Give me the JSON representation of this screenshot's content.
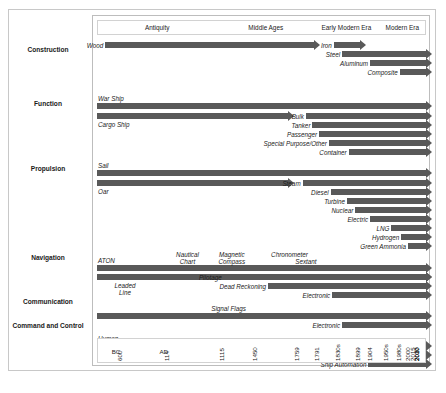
{
  "chart_data": {
    "type": "bar",
    "chart_kind": "timeline-gantt",
    "title": "",
    "xlabel": "",
    "ylabel": "",
    "grid": false,
    "legend": "none",
    "eras": [
      {
        "name": "Antiquity",
        "left_pct": 0.0,
        "width_pct": 36.0
      },
      {
        "name": "Middle Ages",
        "left_pct": 36.0,
        "width_pct": 30.0
      },
      {
        "name": "Early Modern Era",
        "left_pct": 66.0,
        "width_pct": 19.0
      },
      {
        "name": "Modern Era",
        "left_pct": 85.0,
        "width_pct": 15.0
      }
    ],
    "axis_ticks": [
      {
        "label": "600",
        "prefix": "BC",
        "pos_pct": 7.5
      },
      {
        "label": "114",
        "prefix": "AD",
        "pos_pct": 22.0
      },
      {
        "label": "1115",
        "prefix": "",
        "pos_pct": 38.5
      },
      {
        "label": "1450",
        "prefix": "",
        "pos_pct": 48.5
      },
      {
        "label": "1759",
        "prefix": "",
        "pos_pct": 61.5
      },
      {
        "label": "1791",
        "prefix": "",
        "pos_pct": 67.5
      },
      {
        "label": "1830s",
        "prefix": "",
        "pos_pct": 74.0
      },
      {
        "label": "1899",
        "prefix": "",
        "pos_pct": 80.0
      },
      {
        "label": "1904",
        "prefix": "",
        "pos_pct": 83.5
      },
      {
        "label": "1950s",
        "prefix": "",
        "pos_pct": 88.5
      },
      {
        "label": "1980s",
        "prefix": "",
        "pos_pct": 92.5
      },
      {
        "label": "2000",
        "prefix": "",
        "pos_pct": 95.0
      },
      {
        "label": "2015",
        "prefix": "",
        "pos_pct": 96.8
      },
      {
        "label": "2017",
        "prefix": "",
        "pos_pct": 98.0
      },
      {
        "label": "2020",
        "prefix": "",
        "pos_pct": 99.0
      },
      {
        "label": "2030",
        "prefix": "",
        "pos_pct": 100.0
      }
    ],
    "categories": [
      "Construction",
      "Function",
      "Propulsion",
      "Navigation",
      "Communication",
      "Command and Control"
    ],
    "category_label_tops": [
      36,
      90,
      155,
      244,
      288,
      312
    ],
    "bars": [
      {
        "category": "Construction",
        "name": "Wood",
        "start_pct": 2.5,
        "end_pct": 66.0,
        "row_top": 5,
        "label_side": "left"
      },
      {
        "category": "Construction",
        "name": "Iron",
        "start_pct": 72.0,
        "end_pct": 80.0,
        "row_top": 5,
        "label_side": "left"
      },
      {
        "category": "Construction",
        "name": "Steel",
        "start_pct": 74.5,
        "end_pct": 100.0,
        "row_top": 14,
        "label_side": "left"
      },
      {
        "category": "Construction",
        "name": "Aluminum",
        "start_pct": 83.0,
        "end_pct": 100.0,
        "row_top": 23,
        "label_side": "left"
      },
      {
        "category": "Construction",
        "name": "Composite",
        "start_pct": 92.0,
        "end_pct": 100.0,
        "row_top": 32,
        "label_side": "left"
      },
      {
        "category": "Function",
        "name": "War Ship",
        "start_pct": 0.0,
        "end_pct": 100.0,
        "row_top": 66,
        "label_side": "above"
      },
      {
        "category": "Function",
        "name": "Cargo Ship",
        "start_pct": 0.0,
        "end_pct": 58.0,
        "row_top": 76,
        "label_side": "below"
      },
      {
        "category": "Function",
        "name": "Bulk",
        "start_pct": 63.5,
        "end_pct": 100.0,
        "row_top": 76,
        "label_side": "left"
      },
      {
        "category": "Function",
        "name": "Tanker",
        "start_pct": 65.5,
        "end_pct": 100.0,
        "row_top": 85,
        "label_side": "left"
      },
      {
        "category": "Function",
        "name": "Passenger",
        "start_pct": 67.5,
        "end_pct": 100.0,
        "row_top": 94,
        "label_side": "left"
      },
      {
        "category": "Function",
        "name": "Special Purpose/Other",
        "start_pct": 70.5,
        "end_pct": 100.0,
        "row_top": 103,
        "label_side": "left"
      },
      {
        "category": "Function",
        "name": "Container",
        "start_pct": 76.5,
        "end_pct": 100.0,
        "row_top": 112,
        "label_side": "left"
      },
      {
        "category": "Propulsion",
        "name": "Sail",
        "start_pct": 0.0,
        "end_pct": 100.0,
        "row_top": 133,
        "label_side": "above"
      },
      {
        "category": "Propulsion",
        "name": "Oar",
        "start_pct": 0.0,
        "end_pct": 58.0,
        "row_top": 143,
        "label_side": "below"
      },
      {
        "category": "Propulsion",
        "name": "Steam",
        "start_pct": 62.5,
        "end_pct": 100.0,
        "row_top": 143,
        "label_side": "left"
      },
      {
        "category": "Propulsion",
        "name": "Diesel",
        "start_pct": 71.0,
        "end_pct": 100.0,
        "row_top": 152,
        "label_side": "left"
      },
      {
        "category": "Propulsion",
        "name": "Turbine",
        "start_pct": 76.0,
        "end_pct": 100.0,
        "row_top": 161,
        "label_side": "left"
      },
      {
        "category": "Propulsion",
        "name": "Nuclear",
        "start_pct": 78.5,
        "end_pct": 100.0,
        "row_top": 170,
        "label_side": "left"
      },
      {
        "category": "Propulsion",
        "name": "Electric",
        "start_pct": 83.0,
        "end_pct": 100.0,
        "row_top": 179,
        "label_side": "left"
      },
      {
        "category": "Propulsion",
        "name": "LNG",
        "start_pct": 89.5,
        "end_pct": 100.0,
        "row_top": 188,
        "label_side": "left"
      },
      {
        "category": "Propulsion",
        "name": "Hydrogen",
        "start_pct": 92.5,
        "end_pct": 100.0,
        "row_top": 197,
        "label_side": "left"
      },
      {
        "category": "Propulsion",
        "name": "Green Ammonia",
        "start_pct": 94.5,
        "end_pct": 100.0,
        "row_top": 206,
        "label_side": "left"
      },
      {
        "category": "Navigation",
        "name": "ATON",
        "start_pct": 0.0,
        "end_pct": 100.0,
        "row_top": 228,
        "label_side": "above"
      },
      {
        "category": "Navigation",
        "name": "Leaded\nLine",
        "start_pct": 0.0,
        "end_pct": 100.0,
        "row_top": 237,
        "label_side": "below2"
      },
      {
        "category": "Navigation",
        "name": "Pilotage",
        "start_pct": 38.5,
        "end_pct": 100.0,
        "row_top": 237,
        "label_side": "left"
      },
      {
        "category": "Navigation",
        "name": "Dead Reckoning",
        "start_pct": 52.0,
        "end_pct": 100.0,
        "row_top": 246,
        "label_side": "left"
      },
      {
        "category": "Navigation",
        "name": "Electronic",
        "start_pct": 71.5,
        "end_pct": 100.0,
        "row_top": 255,
        "label_side": "left"
      },
      {
        "category": "Communication",
        "name": "Signal Flags",
        "start_pct": 0.0,
        "end_pct": 100.0,
        "row_top": 276,
        "label_side": "above-center"
      },
      {
        "category": "Communication",
        "name": "Electronic",
        "start_pct": 74.5,
        "end_pct": 100.0,
        "row_top": 285,
        "label_side": "left"
      },
      {
        "category": "Command and Control",
        "name": "Human",
        "start_pct": 0.0,
        "end_pct": 100.0,
        "row_top": 306,
        "label_side": "above"
      },
      {
        "category": "Command and Control",
        "name": "System Automation",
        "start_pct": 75.0,
        "end_pct": 100.0,
        "row_top": 315,
        "label_side": "left"
      },
      {
        "category": "Command and Control",
        "name": "Ship Automation",
        "start_pct": 82.5,
        "end_pct": 100.0,
        "row_top": 324,
        "label_side": "left"
      }
    ],
    "floating_labels": [
      {
        "text": "Nautical\nChart",
        "center_pct": 27.5,
        "top": 214
      },
      {
        "text": "Magnetic\nCompass",
        "center_pct": 41.0,
        "top": 214
      },
      {
        "text": "Chronometer",
        "center_pct": 58.5,
        "top": 214
      },
      {
        "text": "Sextant",
        "center_pct": 63.5,
        "top": 221
      }
    ],
    "colors": {
      "bar": "#595959",
      "frame": "#bdbdbd",
      "outer_frame": "#c8c8c8",
      "text": "#1a1a1a",
      "background": "#ffffff"
    }
  },
  "caption": {
    "text": ""
  }
}
